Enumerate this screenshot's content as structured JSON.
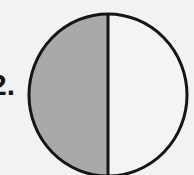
{
  "problem": {
    "number_label": "2."
  },
  "figure": {
    "shape": "circle",
    "parts_total": 2,
    "parts_shaded": 1,
    "fraction": "1/2",
    "shaded_side": "left",
    "colors": {
      "background": "#f2f2f2",
      "shaded": "#a9a9a9",
      "unshaded": "#f4f4f4",
      "stroke": "#151515"
    }
  }
}
